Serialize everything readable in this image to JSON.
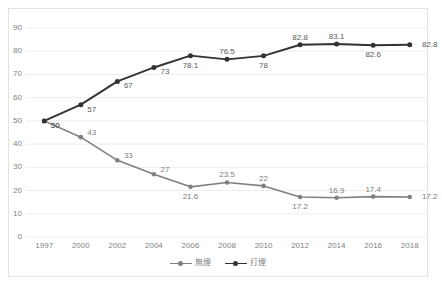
{
  "chart_data": {
    "type": "line",
    "title": "",
    "subtitle": "",
    "xlabel": "",
    "ylabel": "",
    "categories": [
      "1997",
      "2000",
      "2002",
      "2004",
      "2006",
      "2008",
      "2010",
      "2012",
      "2014",
      "2016",
      "2018"
    ],
    "ylim": [
      0,
      90
    ],
    "yticks": [
      "0",
      "10",
      "20",
      "30",
      "40",
      "50",
      "60",
      "70",
      "80",
      "90"
    ],
    "ytick_values": [
      0,
      10,
      20,
      30,
      40,
      50,
      60,
      70,
      80,
      90
    ],
    "grid": "horizontal",
    "legend_position": "bottom-center",
    "series": [
      {
        "name": "無煙",
        "color": "#808080",
        "marker": "circle",
        "values": [
          50,
          43,
          33,
          27,
          21.6,
          23.5,
          22,
          17.2,
          16.9,
          17.4,
          17.2
        ],
        "labels": [
          "50",
          "43",
          "33",
          "27",
          "21.6",
          "23.5",
          "22",
          "17.2",
          "16.9",
          "17.4",
          "17.2"
        ],
        "label_positions": [
          "below-right",
          "above-right",
          "above-right",
          "above-right",
          "below-center",
          "above-center",
          "above-center",
          "below-center",
          "above-center",
          "above-center",
          "right"
        ]
      },
      {
        "name": "打煙",
        "color": "#333333",
        "marker": "circle",
        "values": [
          50,
          57,
          67,
          73,
          78.1,
          76.5,
          78,
          82.8,
          83.1,
          82.6,
          82.8
        ],
        "labels": [
          "50",
          "57",
          "67",
          "73",
          "78.1",
          "76.5",
          "78",
          "82.8",
          "83.1",
          "82.6",
          "82.8"
        ],
        "label_positions": [
          "below-right",
          "below-right",
          "below-right",
          "below-right",
          "below-center",
          "above-center",
          "below-center",
          "above-center",
          "above-center",
          "below-center",
          "right"
        ]
      }
    ]
  },
  "legend": {
    "items": [
      {
        "label": "無煙",
        "color": "#808080"
      },
      {
        "label": "打煙",
        "color": "#333333"
      }
    ]
  },
  "colors": {
    "series_gray": "#808080",
    "series_dark": "#333333",
    "gridline": "#ededed",
    "axis_text": "#7f7f7f",
    "frame_border": "#e2e2e2",
    "background": "#ffffff"
  }
}
